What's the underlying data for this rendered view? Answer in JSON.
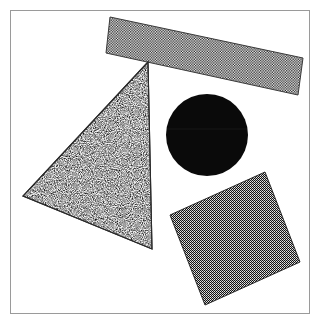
{
  "figure": {
    "title": "Textured geometric shapes",
    "background_color": "#ffffff",
    "frame": {
      "border_color": "#9a9a9a",
      "border_width": 1,
      "x": 10,
      "y": 10,
      "width": 300,
      "height": 304
    },
    "shape_count": 4
  },
  "shapes": [
    {
      "id": "bar",
      "name": "checkered-bar",
      "kind": "rectangle",
      "label": "Tilted checkered bar",
      "texture": "fine-checkerboard",
      "fill_color": "#6f6f6f",
      "outline_color": "#444444",
      "rotation_deg": 12,
      "center_x": 207,
      "center_y": 56,
      "width": 198,
      "height": 26,
      "points": "110,17 303,58 298,95 106,53"
    },
    {
      "id": "triangle",
      "name": "speckled-triangle",
      "kind": "triangle",
      "label": "Speckled triangle",
      "texture": "random-dot-noise",
      "fill_color": "#d2d2d2",
      "outline_color": "#2b2b2b",
      "rotation_deg": 0,
      "center_x": 108,
      "center_y": 169,
      "points": "148,62 23,196 152,249"
    },
    {
      "id": "circle",
      "name": "solid-black-circle",
      "kind": "circle",
      "label": "Solid black circle",
      "texture": "solid",
      "fill_color": "#0a0a0a",
      "outline_color": "#0a0a0a",
      "center_x": 207,
      "center_y": 135,
      "radius": 41
    },
    {
      "id": "square",
      "name": "dark-checkered-square",
      "kind": "square",
      "label": "Rotated dark checkered square",
      "texture": "dense-checkerboard",
      "fill_color": "#3b3b3b",
      "outline_color": "#2a2a2a",
      "rotation_deg": 24,
      "center_x": 235,
      "center_y": 238,
      "side": 131,
      "points": "265,172 300,262 205,305 170,215"
    }
  ]
}
